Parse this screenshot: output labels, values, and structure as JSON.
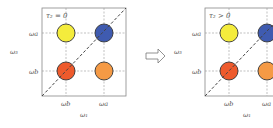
{
  "panels": [
    {
      "condition": "τ₂ = 0",
      "y_axis_label": "ω₃",
      "x_axis_label": "ω₁",
      "y_ticks": [
        "ωa",
        "ωb"
      ],
      "x_ticks": [
        "ωb",
        "ωa"
      ],
      "peaks": [
        {
          "name": "top-left",
          "color": "#f4ec3c"
        },
        {
          "name": "top-right",
          "color": "#3f5bb0"
        },
        {
          "name": "bottom-left",
          "color": "#ee5a2c"
        },
        {
          "name": "bottom-right",
          "color": "#f59a45"
        }
      ]
    },
    {
      "condition": "τ₂ > 0",
      "y_axis_label": "ω₃",
      "x_axis_label": "ω₁",
      "y_ticks": [
        "ωa",
        "ωb"
      ],
      "x_ticks": [
        "ωb",
        "ωa"
      ],
      "peaks": [
        {
          "name": "top-left",
          "color": "#f4ec3c"
        },
        {
          "name": "top-right",
          "color": "#3f5bb0"
        },
        {
          "name": "bottom-left",
          "color": "#ee5a2c"
        },
        {
          "name": "bottom-right",
          "color": "#f59a45"
        }
      ]
    }
  ],
  "arrow": "transition-arrow"
}
